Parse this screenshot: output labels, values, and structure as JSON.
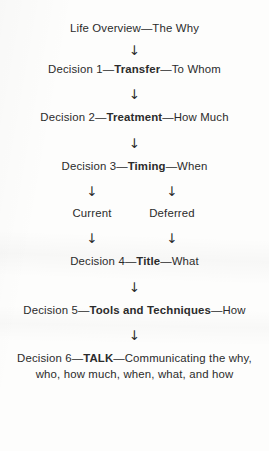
{
  "diagram": {
    "background_color": "#fdfdfc",
    "text_color": "#2b2b2b",
    "arrow_glyph": "↓",
    "arrow_icon_name": "down-arrow-icon",
    "nodes": {
      "life_overview": {
        "prefix": "Life Overview",
        "dash1": "—",
        "keyword": "",
        "dash2": "",
        "suffix": "The Why",
        "full_text": "Life Overview—The Why"
      },
      "decision1": {
        "prefix": "Decision 1",
        "dash1": "—",
        "keyword": "Transfer",
        "dash2": "—",
        "suffix": "To Whom"
      },
      "decision2": {
        "prefix": "Decision 2",
        "dash1": "—",
        "keyword": "Treatment",
        "dash2": "—",
        "suffix": "How Much"
      },
      "decision3": {
        "prefix": "Decision 3",
        "dash1": "—",
        "keyword": "Timing",
        "dash2": "—",
        "suffix": "When"
      },
      "branch_current": "Current",
      "branch_deferred": "Deferred",
      "decision4": {
        "prefix": "Decision 4",
        "dash1": "—",
        "keyword": "Title",
        "dash2": "—",
        "suffix": "What"
      },
      "decision5": {
        "prefix": "Decision 5",
        "dash1": "—",
        "keyword": "Tools and Techniques",
        "dash2": "—",
        "suffix": "How"
      },
      "decision6": {
        "prefix": "Decision 6",
        "dash1": "—",
        "keyword": "TALK",
        "dash2": "—",
        "suffix": "Communicating the why, who, how much, when, what, and how"
      }
    }
  }
}
